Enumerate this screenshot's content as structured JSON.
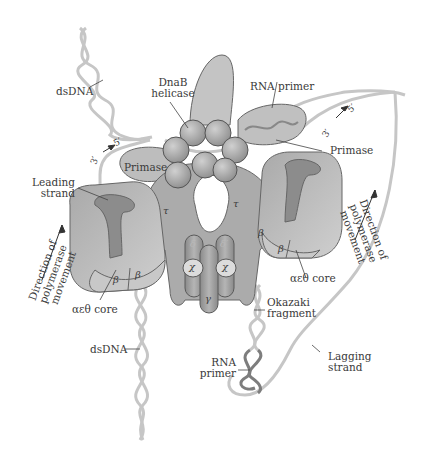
{
  "figure": {
    "colors": {
      "background": "#ffffff",
      "protein_fill": "#b3b3b3",
      "protein_dark": "#8a8a8a",
      "protein_light": "#d6d6d6",
      "dna_strand": "#c4c4c4",
      "rna_primer": "#7d7d7d",
      "outline": "#555555",
      "label_text": "#3a3a3a"
    }
  },
  "labels": {
    "dsDNA_top": "dsDNA",
    "dnab_helicase_line1": "DnaB",
    "dnab_helicase_line2": "helicase",
    "rna_primer_top": "RNA primer",
    "primase_left": "Primase",
    "primase_right": "Primase",
    "leading_strand_line1": "Leading",
    "leading_strand_line2": "strand",
    "direction_left_line1": "Direction of",
    "direction_left_line2": "polymerase",
    "direction_left_line3": "movement",
    "direction_right_line1": "Direction of",
    "direction_right_line2": "polymerase",
    "direction_right_line3": "movement",
    "core_left": "αεθ core",
    "core_right": "αεθ core",
    "dsDNA_bottom": "dsDNA",
    "okazaki_line1": "Okazaki",
    "okazaki_line2": "fragment",
    "rna_primer_bottom_line1": "RNA",
    "rna_primer_bottom_line2": "primer",
    "lagging_line1": "Lagging",
    "lagging_line2": "strand",
    "polarity_left_3": "3′",
    "polarity_left_5": "5′",
    "polarity_right_3": "3′",
    "polarity_right_5": "5′"
  },
  "subunits": {
    "tau_left": "τ",
    "tau_right": "τ",
    "delta": "δ",
    "delta_prime": "δ′",
    "chi_left": "χ",
    "chi_right": "χ",
    "gamma": "γ",
    "beta_left_1": "β",
    "beta_left_2": "β",
    "beta_right_1": "β",
    "beta_right_2": "β"
  }
}
